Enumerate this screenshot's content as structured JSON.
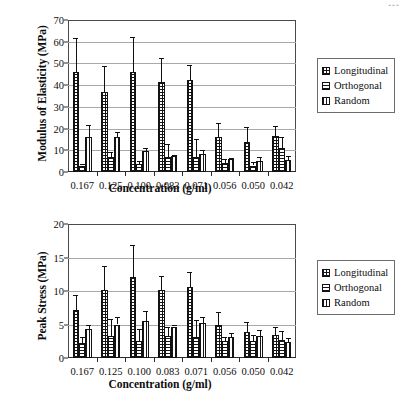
{
  "page_mark": "▪▪▪",
  "legend": {
    "items": [
      {
        "label": "Longitudinal",
        "pattern": "grid"
      },
      {
        "label": "Orthogonal",
        "pattern": "horiz"
      },
      {
        "label": "Random",
        "pattern": "vert"
      }
    ]
  },
  "chart_data": [
    {
      "id": "modulus-of-elasticity",
      "type": "bar",
      "title": "",
      "xlabel": "Concentration (g/ml)",
      "ylabel": "Modulus of Elasticity (MPa)",
      "categories": [
        "0.167",
        "0.125",
        "0.100",
        "0.083",
        "0.071",
        "0.056",
        "0.050",
        "0.042"
      ],
      "ylim": [
        0,
        70
      ],
      "yticks": [
        0,
        10,
        20,
        30,
        40,
        50,
        60,
        70
      ],
      "grid": true,
      "legend_position": "right",
      "series": [
        {
          "name": "Longitudinal",
          "pattern": "grid",
          "values": [
            46.0,
            37.0,
            46.0,
            41.5,
            42.5,
            16.0,
            14.0,
            16.5
          ],
          "errors": [
            15.5,
            12.0,
            16.0,
            11.0,
            7.0,
            6.5,
            6.5,
            4.5
          ]
        },
        {
          "name": "Orthogonal",
          "pattern": "horiz",
          "values": [
            3.0,
            7.0,
            3.5,
            7.0,
            7.0,
            4.0,
            3.0,
            11.0
          ],
          "errors": [
            0.6,
            2.0,
            1.5,
            6.0,
            8.0,
            2.0,
            1.5,
            5.0
          ]
        },
        {
          "name": "Random",
          "pattern": "vert",
          "values": [
            16.0,
            16.0,
            9.5,
            7.5,
            8.5,
            6.0,
            5.0,
            5.5
          ],
          "errors": [
            5.5,
            2.5,
            1.5,
            0.4,
            1.5,
            0.5,
            2.0,
            2.0
          ]
        }
      ]
    },
    {
      "id": "peak-stress",
      "type": "bar",
      "title": "",
      "xlabel": "Concentration (g/ml)",
      "ylabel": "Peak Stress (MPa)",
      "categories": [
        "0.167",
        "0.125",
        "0.100",
        "0.083",
        "0.071",
        "0.056",
        "0.050",
        "0.042"
      ],
      "ylim": [
        0,
        20
      ],
      "yticks": [
        0,
        5,
        10,
        15,
        20
      ],
      "grid": true,
      "legend_position": "right",
      "series": [
        {
          "name": "Longitudinal",
          "pattern": "grid",
          "values": [
            7.1,
            10.2,
            12.1,
            10.1,
            10.6,
            4.9,
            3.9,
            3.5
          ],
          "errors": [
            2.3,
            3.5,
            4.7,
            2.2,
            2.3,
            2.0,
            1.5,
            1.2
          ]
        },
        {
          "name": "Orthogonal",
          "pattern": "horiz",
          "values": [
            2.2,
            3.3,
            2.5,
            3.3,
            3.1,
            2.5,
            2.5,
            2.7
          ],
          "errors": [
            1.0,
            2.5,
            1.9,
            1.3,
            2.5,
            0.6,
            1.0,
            1.4
          ]
        },
        {
          "name": "Random",
          "pattern": "vert",
          "values": [
            4.4,
            5.0,
            5.5,
            4.7,
            5.2,
            3.1,
            3.3,
            2.4
          ],
          "errors": [
            0.5,
            1.1,
            1.5,
            0.2,
            0.9,
            0.7,
            0.9,
            0.6
          ]
        }
      ]
    }
  ]
}
